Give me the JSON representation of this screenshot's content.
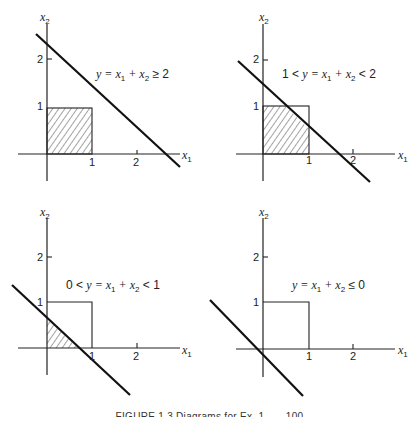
{
  "figure": {
    "caption_partial": "FIGURE 1.3  Diagrams for Ex. 1...  ...100"
  },
  "panels": [
    {
      "id": "top-left",
      "x_axis_label": "x",
      "x_axis_sub": "1",
      "y_axis_label": "x",
      "y_axis_sub": "2",
      "x_ticks": [
        "1",
        "2"
      ],
      "y_ticks": [
        "1",
        "2"
      ],
      "equation": {
        "pre": "",
        "mid": "y = x",
        "s1": "1",
        "plus": " + x",
        "s2": "2",
        "post": " ≥ 2"
      },
      "shaded_region": "full unit square",
      "line_intercept": 2.5
    },
    {
      "id": "top-right",
      "x_axis_label": "x",
      "x_axis_sub": "1",
      "y_axis_label": "x",
      "y_axis_sub": "2",
      "x_ticks": [
        "1",
        "2"
      ],
      "y_ticks": [
        "1",
        "2"
      ],
      "equation": {
        "pre": "1 < ",
        "mid": "y = x",
        "s1": "1",
        "plus": " + x",
        "s2": "2",
        "post": " < 2"
      },
      "shaded_region": "unit square below line",
      "line_intercept": 1.5
    },
    {
      "id": "bottom-left",
      "x_axis_label": "x",
      "x_axis_sub": "1",
      "y_axis_label": "x",
      "y_axis_sub": "2",
      "x_ticks": [
        "1",
        "2"
      ],
      "y_ticks": [
        "1",
        "2"
      ],
      "equation": {
        "pre": "0 < ",
        "mid": "y = x",
        "s1": "1",
        "plus": " + x",
        "s2": "2",
        "post": " < 1"
      },
      "shaded_region": "triangle below line",
      "line_intercept": 0.7
    },
    {
      "id": "bottom-right",
      "x_axis_label": "x",
      "x_axis_sub": "1",
      "y_axis_label": "x",
      "y_axis_sub": "2",
      "x_ticks": [
        "1",
        "2"
      ],
      "y_ticks": [
        "1",
        "2"
      ],
      "equation": {
        "pre": "",
        "mid": "y = x",
        "s1": "1",
        "plus": " + x",
        "s2": "2",
        "post": " ≤ 0"
      },
      "shaded_region": "none",
      "line_intercept": -0.3
    }
  ]
}
